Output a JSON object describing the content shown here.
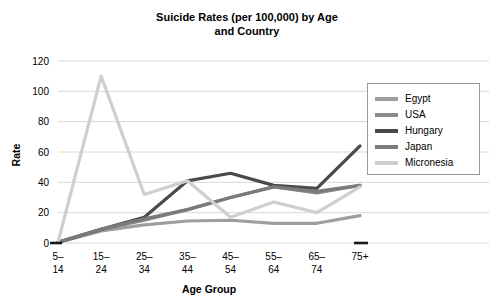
{
  "chart_data": {
    "type": "line",
    "title": "Suicide Rates (per 100,000) by Age and Country",
    "title_line1": "Suicide Rates (per 100,000) by Age",
    "title_line2": "and Country",
    "xlabel": "Age Group",
    "ylabel": "Rate",
    "categories": [
      "5–14",
      "15–24",
      "25–34",
      "35–44",
      "45–54",
      "55–64",
      "65–74",
      "75+"
    ],
    "category_lines": [
      [
        "5–",
        "14"
      ],
      [
        "15–",
        "24"
      ],
      [
        "25–",
        "34"
      ],
      [
        "35–",
        "44"
      ],
      [
        "45–",
        "54"
      ],
      [
        "55–",
        "64"
      ],
      [
        "65–",
        "74"
      ],
      [
        "75+",
        ""
      ]
    ],
    "ylim": [
      0,
      120
    ],
    "yticks": [
      0,
      20,
      40,
      60,
      80,
      100,
      120
    ],
    "ytick_labels": [
      "0",
      "20",
      "40",
      "60",
      "80",
      "100",
      "120"
    ],
    "grid": true,
    "grid_axis": "y",
    "legend_position": "right",
    "series": [
      {
        "name": "Egypt",
        "color": "#9e9e9e",
        "values": [
          0.3,
          8,
          12,
          14.5,
          15,
          13,
          13,
          18
        ]
      },
      {
        "name": "USA",
        "color": "#8a8a8a",
        "values": [
          0.5,
          9,
          15,
          22,
          30,
          37,
          33,
          38
        ]
      },
      {
        "name": "Hungary",
        "color": "#4a4a4a",
        "values": [
          0.5,
          9,
          17,
          41,
          46,
          38,
          36,
          64
        ]
      },
      {
        "name": "Japan",
        "color": "#7a7a7a",
        "values": [
          0.5,
          9,
          16,
          22,
          30,
          37,
          34,
          38
        ]
      },
      {
        "name": "Micronesia",
        "color": "#cfcfcf",
        "values": [
          0.5,
          110,
          32,
          41,
          17,
          27,
          20,
          37
        ]
      }
    ]
  },
  "legend": {
    "items": [
      {
        "label": "Egypt",
        "color": "#9e9e9e"
      },
      {
        "label": "USA",
        "color": "#8a8a8a"
      },
      {
        "label": "Hungary",
        "color": "#4a4a4a"
      },
      {
        "label": "Japan",
        "color": "#7a7a7a"
      },
      {
        "label": "Micronesia",
        "color": "#cfcfcf"
      }
    ]
  },
  "style": {
    "grid_color": "#d8d8d8",
    "axis_color": "#1a1a1a",
    "background": "#ffffff"
  }
}
